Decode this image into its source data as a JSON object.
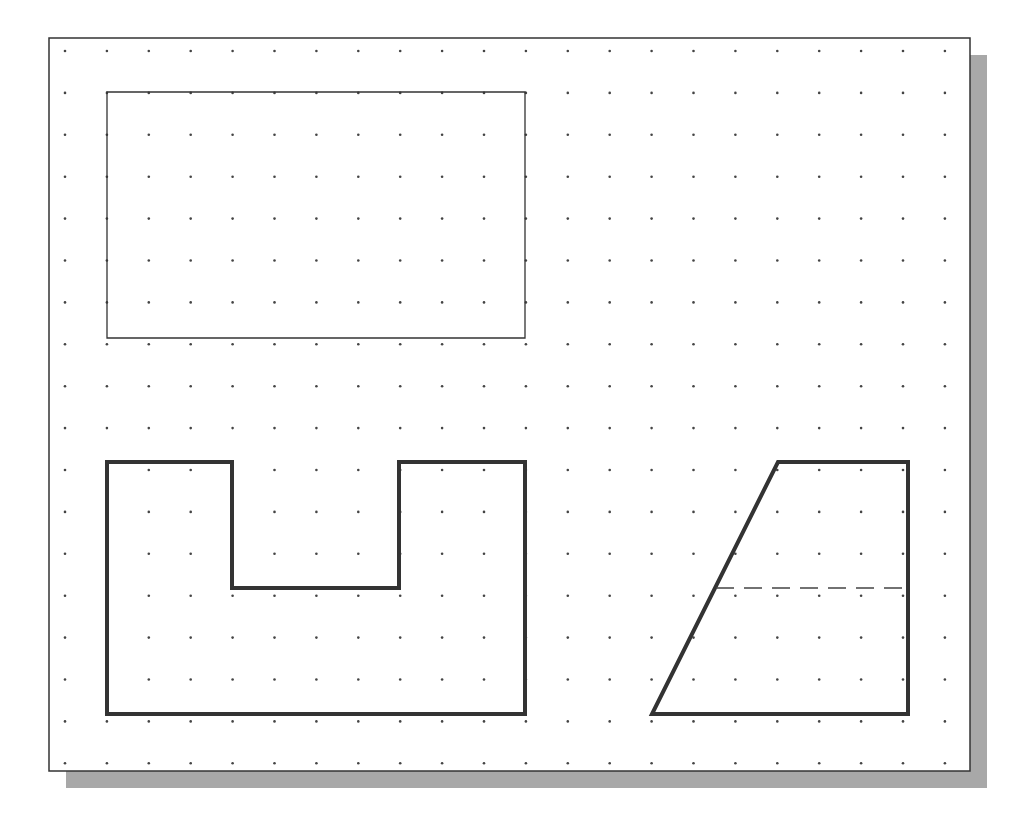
{
  "canvas": {
    "width": 1024,
    "height": 829,
    "background": "#ffffff"
  },
  "sheet": {
    "x": 49,
    "y": 38,
    "width": 921,
    "height": 733,
    "border_color": "#333333",
    "shadow": {
      "offset": 17,
      "color": "#a8a8a8"
    }
  },
  "grid": {
    "origin_x": 65,
    "origin_y": 51,
    "spacing": 41.9,
    "cols": 22,
    "rows": 18,
    "dot_color": "#444444",
    "dot_radius": 1.3
  },
  "shapes": {
    "rectangle": {
      "label": "top-view-rectangle",
      "points": [
        [
          107,
          92
        ],
        [
          525,
          92
        ],
        [
          525,
          338
        ],
        [
          107,
          338
        ]
      ],
      "stroke": "#333333",
      "stroke_width": 1.3
    },
    "u_profile": {
      "label": "front-view-u-shape",
      "points": [
        [
          107,
          462
        ],
        [
          232,
          462
        ],
        [
          232,
          588
        ],
        [
          399,
          588
        ],
        [
          399,
          462
        ],
        [
          525,
          462
        ],
        [
          525,
          714
        ],
        [
          107,
          714
        ]
      ],
      "stroke": "#333333",
      "stroke_width": 4
    },
    "trapezoid": {
      "label": "side-view-trapezoid",
      "points": [
        [
          778,
          462
        ],
        [
          908,
          462
        ],
        [
          908,
          714
        ],
        [
          652,
          714
        ]
      ],
      "stroke": "#333333",
      "stroke_width": 4
    },
    "hidden_line": {
      "label": "hidden-line-dashed",
      "x1": 716,
      "y1": 588,
      "x2": 908,
      "y2": 588,
      "stroke": "#444444",
      "stroke_width": 1.3,
      "dash": "18,10"
    }
  }
}
